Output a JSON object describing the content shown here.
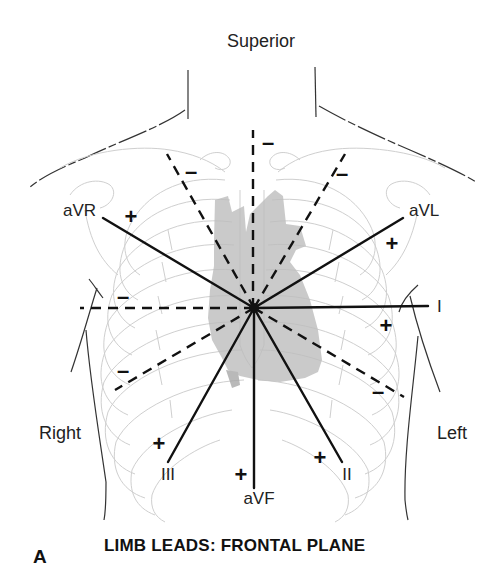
{
  "figure": {
    "panel_label": "A",
    "title": "LIMB LEADS: FRONTAL PLANE",
    "orientation": {
      "superior": "Superior",
      "right": "Right",
      "left": "Left"
    },
    "center": {
      "x": 254,
      "y": 308
    },
    "leads": [
      {
        "name": "I",
        "label": "I",
        "angle_deg": 0,
        "positive_sign": "+",
        "negative_sign": "–"
      },
      {
        "name": "II",
        "label": "II",
        "angle_deg": 60,
        "positive_sign": "+",
        "negative_sign": "–"
      },
      {
        "name": "III",
        "label": "III",
        "angle_deg": 120,
        "positive_sign": "+",
        "negative_sign": "–"
      },
      {
        "name": "aVR",
        "label": "aVR",
        "angle_deg": -150,
        "positive_sign": "+",
        "negative_sign": "–"
      },
      {
        "name": "aVL",
        "label": "aVL",
        "angle_deg": -30,
        "positive_sign": "+",
        "negative_sign": "–"
      },
      {
        "name": "aVF",
        "label": "aVF",
        "angle_deg": 90,
        "positive_sign": "+",
        "negative_sign": "–"
      }
    ],
    "legend_note": {
      "solid_line": "positive pole of lead",
      "dashed_line": "negative pole of lead"
    },
    "colors": {
      "lead_lines": "#111111",
      "anatomy_outline": "#c8c8c8",
      "heart_fill": "#bdbdbd",
      "body_outline": "#333333"
    }
  }
}
